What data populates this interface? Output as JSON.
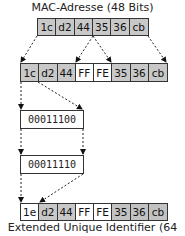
{
  "title_top": "MAC-Adresse (48 Bits)",
  "title_bottom": "Extended Unique Identifier (64 Bits)",
  "mac_row": [
    "1c",
    "d2",
    "44",
    "35",
    "36",
    "cb"
  ],
  "eui_intermediate_row": [
    "1c",
    "d2",
    "44",
    "FF",
    "FE",
    "35",
    "36",
    "cb"
  ],
  "binary_before": "00011100",
  "binary_after": "00011110",
  "eui_final_row": [
    "1e",
    "d2",
    "44",
    "FF",
    "FE",
    "35",
    "36",
    "cb"
  ],
  "colors": {
    "gray_cell": "#c8c8c8",
    "white_cell": "#ffffff",
    "border": "#333333"
  }
}
